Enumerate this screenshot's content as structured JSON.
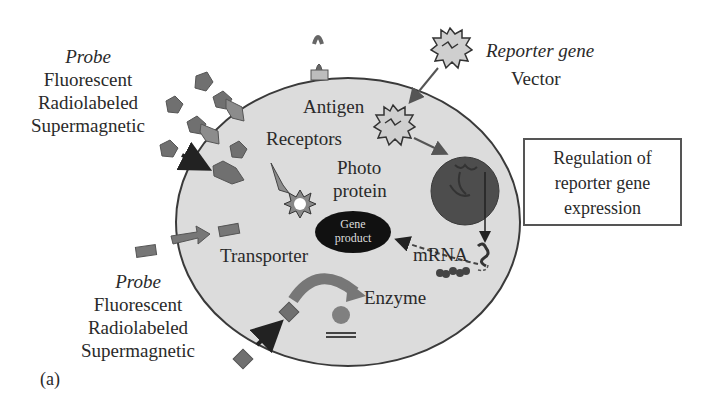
{
  "figure": {
    "panel_label": "(a)",
    "colors": {
      "cell_fill": "#dcdcdc",
      "cell_stroke": "#3a3a3a",
      "probe_fill": "#6e6e6e",
      "nucleus_fill": "#4a4a4a",
      "gene_product_fill": "#111111",
      "arrow": "#222222"
    }
  },
  "probe_top": {
    "title": "Probe",
    "types": [
      "Fluorescent",
      "Radiolabeled",
      "Supermagnetic"
    ]
  },
  "probe_bottom": {
    "title": "Probe",
    "types": [
      "Fluorescent",
      "Radiolabeled",
      "Supermagnetic"
    ]
  },
  "reporter": {
    "title": "Reporter gene",
    "subtitle": "Vector"
  },
  "cell_labels": {
    "antigen": "Antigen",
    "receptors": "Receptors",
    "photoprotein_line1": "Photo",
    "photoprotein_line2": "protein",
    "gene_product_line1": "Gene",
    "gene_product_line2": "product",
    "transporter": "Transporter",
    "mrna": "mRNA",
    "enzyme": "Enzyme"
  },
  "regulation_box": {
    "lines": [
      "Regulation of",
      "reporter gene",
      "expression"
    ]
  }
}
